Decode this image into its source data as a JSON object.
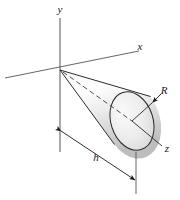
{
  "figure": {
    "background_color": "#ffffff",
    "line_color": "#2b2b2b",
    "shade_light": "#ffffff",
    "shade_mid": "#e2e2e2",
    "shade_dark": "#b9b9b9"
  },
  "axes": [
    {
      "id": "y-axis",
      "label": "y",
      "label_x": 60,
      "label_y": 12,
      "description": "vertical axis pointing up"
    },
    {
      "id": "x-axis",
      "label": "x",
      "label_x": 140,
      "label_y": 49,
      "description": "axis receding up and to the right"
    },
    {
      "id": "z-axis",
      "label": "z",
      "label_x": 166,
      "label_y": 151,
      "description": "axis running down and to the right through the cone centerline"
    }
  ],
  "dimensions": [
    {
      "id": "radius",
      "label": "R",
      "label_x": 160,
      "label_y": 100,
      "description": "radius of the circular base of the cone, leader arrow from label to base rim"
    },
    {
      "id": "height",
      "label": "h",
      "label_x": 96,
      "label_y": 160,
      "description": "axial length of the cone, double headed dimension line below the cone"
    }
  ],
  "solid": {
    "name": "cone",
    "apex": {
      "x": 60,
      "y": 70
    },
    "base_center": {
      "x": 132,
      "y": 121
    },
    "base_radius_x": 21,
    "base_radius_y": 30,
    "base_tilt_deg": -18
  }
}
